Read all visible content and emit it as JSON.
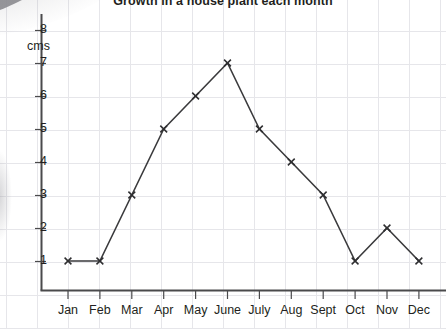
{
  "chart_data": {
    "type": "line",
    "title": "Growth in a house plant each month",
    "xlabel": "",
    "ylabel": "cms",
    "categories": [
      "Jan",
      "Feb",
      "Mar",
      "Apr",
      "May",
      "June",
      "July",
      "Aug",
      "Sept",
      "Oct",
      "Nov",
      "Dec"
    ],
    "values": [
      1,
      1,
      3,
      5,
      6,
      7,
      5,
      4,
      3,
      1,
      2,
      1
    ],
    "ylim": [
      0,
      8
    ],
    "ytick_labels": [
      "1",
      "2",
      "3",
      "4",
      "5",
      "6",
      "7",
      "8"
    ],
    "ytick_values": [
      1,
      2,
      3,
      4,
      5,
      6,
      7,
      8
    ],
    "grid": true,
    "legend": false,
    "marker": "x-cross",
    "line_color": "#3a3a3c",
    "grid_color": "#e6e6ea",
    "axis_color": "#4a4a4c",
    "text_color": "#231f20"
  }
}
